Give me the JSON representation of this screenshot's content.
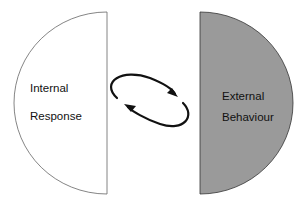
{
  "diagram": {
    "left": {
      "line1": "Internal",
      "line2": "Response",
      "fill": "#ffffff",
      "stroke": "#666666"
    },
    "right": {
      "line1": "External",
      "line2": "Behaviour",
      "fill": "#9a9a9a",
      "stroke": "#333333"
    },
    "cycle_arrows": {
      "color": "#111111",
      "description": "two curved arrows forming a clockwise loop"
    }
  }
}
